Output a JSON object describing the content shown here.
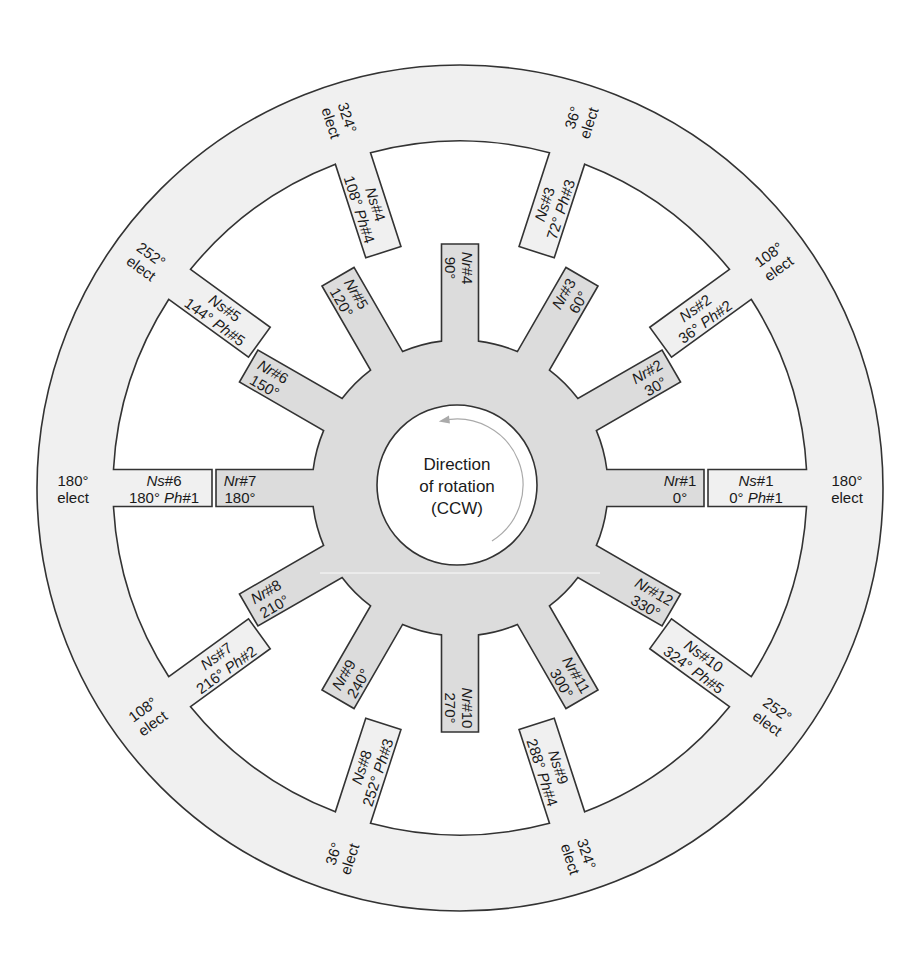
{
  "diagram": {
    "center": {
      "x": 460,
      "y": 488
    },
    "colors": {
      "stator_fill": "#f0f0f0",
      "rotor_fill": "#dcdcdc",
      "outline": "#333333",
      "background": "#ffffff",
      "arrow": "#aaaaaa"
    },
    "geometry": {
      "stator_outer_r": 423,
      "stator_inner_r": 347,
      "stator_tooth_tip_r": 248,
      "stator_tooth_width": 37,
      "rotor_hub_r": 148,
      "rotor_tooth_tip_r": 244,
      "rotor_tooth_width": 37,
      "bore_r": 80
    },
    "center_label": {
      "line1": "Direction",
      "line2": "of rotation",
      "line3": "(CCW)"
    },
    "rotor_poles": [
      {
        "name": "Nr",
        "num": "#1",
        "angle": "0°",
        "deg": 0
      },
      {
        "name": "Nr",
        "num": "#2",
        "angle": "30°",
        "deg": 30
      },
      {
        "name": "Nr",
        "num": "#3",
        "angle": "60°",
        "deg": 60
      },
      {
        "name": "Nr",
        "num": "#4",
        "angle": "90°",
        "deg": 90
      },
      {
        "name": "Nr",
        "num": "#5",
        "angle": "120°",
        "deg": 120
      },
      {
        "name": "Nr",
        "num": "#6",
        "angle": "150°",
        "deg": 150
      },
      {
        "name": "Nr",
        "num": "#7",
        "angle": "180°",
        "deg": 180
      },
      {
        "name": "Nr",
        "num": "#8",
        "angle": "210°",
        "deg": 210
      },
      {
        "name": "Nr",
        "num": "#9",
        "angle": "240°",
        "deg": 240
      },
      {
        "name": "Nr",
        "num": "#10",
        "angle": "270°",
        "deg": 270
      },
      {
        "name": "Nr",
        "num": "#11",
        "angle": "300°",
        "deg": 300
      },
      {
        "name": "Nr",
        "num": "#12",
        "angle": "330°",
        "deg": 330
      }
    ],
    "stator_poles": [
      {
        "name": "Ns",
        "num": "#1",
        "angle": "0°",
        "ph": "Ph",
        "phnum": "#1",
        "deg": 0,
        "elect": "180°"
      },
      {
        "name": "Ns",
        "num": "#2",
        "angle": "36°",
        "ph": "Ph",
        "phnum": "#2",
        "deg": 36,
        "elect": "108°"
      },
      {
        "name": "Ns",
        "num": "#3",
        "angle": "72°",
        "ph": "Ph",
        "phnum": "#3",
        "deg": 72,
        "elect": "36°"
      },
      {
        "name": "Ns",
        "num": "#4",
        "angle": "108°",
        "ph": "Ph",
        "phnum": "#4",
        "deg": 108,
        "elect": "324°"
      },
      {
        "name": "Ns",
        "num": "#5",
        "angle": "144°",
        "ph": "Ph",
        "phnum": "#5",
        "deg": 144,
        "elect": "252°"
      },
      {
        "name": "Ns",
        "num": "#6",
        "angle": "180°",
        "ph": "Ph",
        "phnum": "#1",
        "deg": 180,
        "elect": "180°"
      },
      {
        "name": "Ns",
        "num": "#7",
        "angle": "216°",
        "ph": "Ph",
        "phnum": "#2",
        "deg": 216,
        "elect": "108°"
      },
      {
        "name": "Ns",
        "num": "#8",
        "angle": "252°",
        "ph": "Ph",
        "phnum": "#3",
        "deg": 252,
        "elect": "36°"
      },
      {
        "name": "Ns",
        "num": "#9",
        "angle": "288°",
        "ph": "Ph",
        "phnum": "#4",
        "deg": 288,
        "elect": "324°"
      },
      {
        "name": "Ns",
        "num": "#10",
        "angle": "324°",
        "ph": "Ph",
        "phnum": "#5",
        "deg": 324,
        "elect": "252°"
      }
    ],
    "elect_suffix": "elect"
  }
}
